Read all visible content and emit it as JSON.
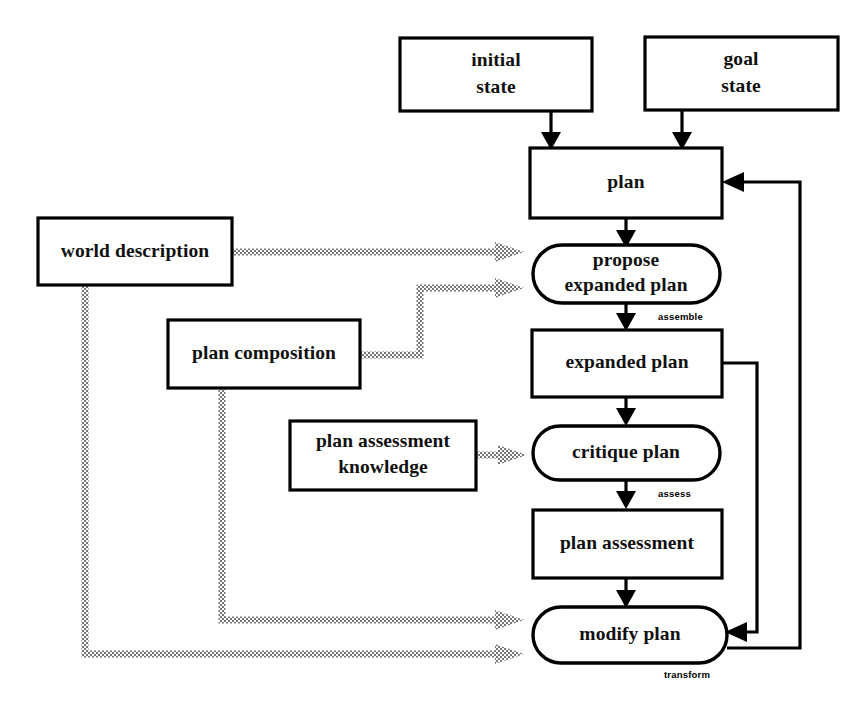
{
  "diagram": {
    "colors": {
      "stroke": "#000000",
      "fill": "#ffffff",
      "dither": "#8a8a8a",
      "text": "#111111"
    },
    "nodes": {
      "initial_state": {
        "label_line1": "initial",
        "label_line2": "state",
        "shape": "rect"
      },
      "goal_state": {
        "label_line1": "goal",
        "label_line2": "state",
        "shape": "rect"
      },
      "plan": {
        "label_line1": "plan",
        "shape": "rect"
      },
      "propose_expanded_plan": {
        "label_line1": "propose",
        "label_line2": "expanded plan",
        "shape": "stadium"
      },
      "expanded_plan": {
        "label_line1": "expanded plan",
        "shape": "rect"
      },
      "critique_plan": {
        "label_line1": "critique plan",
        "shape": "stadium"
      },
      "plan_assessment": {
        "label_line1": "plan assessment",
        "shape": "rect"
      },
      "modify_plan": {
        "label_line1": "modify plan",
        "shape": "stadium"
      },
      "world_description": {
        "label_line1": "world description",
        "shape": "rect"
      },
      "plan_composition": {
        "label_line1": "plan composition",
        "shape": "rect"
      },
      "plan_assessment_knowledge": {
        "label_line1": "plan assessment",
        "label_line2": "knowledge",
        "shape": "rect"
      }
    },
    "edge_labels": {
      "assemble": "assemble",
      "assess": "assess",
      "transform": "transform"
    }
  }
}
